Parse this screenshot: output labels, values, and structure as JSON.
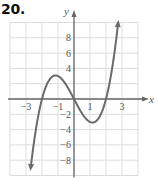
{
  "problem": {
    "number": "20."
  },
  "chart_data": {
    "type": "line",
    "title": "",
    "xlabel": "x",
    "ylabel": "y",
    "xlim": [
      -4,
      4
    ],
    "ylim": [
      -10,
      10
    ],
    "grid": true,
    "x_ticks": [
      {
        "value": -3,
        "label": "−3"
      },
      {
        "value": -1,
        "label": "−1"
      },
      {
        "value": 1,
        "label": "1"
      },
      {
        "value": 3,
        "label": "3"
      }
    ],
    "y_ticks": [
      {
        "value": 8,
        "label": "8"
      },
      {
        "value": 6,
        "label": "6"
      },
      {
        "value": 4,
        "label": "4"
      },
      {
        "value": -2,
        "label": "−2"
      },
      {
        "value": -4,
        "label": "−4"
      },
      {
        "value": -6,
        "label": "−6"
      },
      {
        "value": -8,
        "label": "−8"
      }
    ],
    "series": [
      {
        "name": "f(x)",
        "description": "cubic curve with roots near -2, 0, 2; local max (-1, 3); local min (1, -3); arrows at both ends",
        "x": [
          -2.7,
          -2.5,
          -2,
          -1.5,
          -1,
          -0.5,
          0,
          0.5,
          1,
          1.5,
          2,
          2.5,
          2.75
        ],
        "y": [
          -8.9,
          -5.6,
          0,
          2.6,
          3,
          1.9,
          0,
          -1.9,
          -3,
          -2.6,
          0,
          5.6,
          9.8
        ]
      }
    ],
    "colors": {
      "grid": "#dcdcdc",
      "axis": "#666666",
      "curve": "#6a6a6a",
      "text": "#555555"
    }
  }
}
